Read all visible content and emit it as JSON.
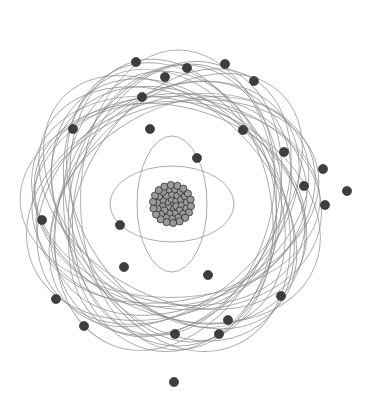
{
  "diagram": {
    "title": "Atom model illustration",
    "colors": {
      "background": "#ffffff",
      "orbit": "#8a8a8a",
      "electron": "#3e3e3e",
      "nucleus": "#9a9a9a"
    },
    "center": [
      174,
      204
    ],
    "nucleus": {
      "cx": 172,
      "cy": 204,
      "r": 21
    },
    "inner_orbits": [
      {
        "rx": 62,
        "ry": 38,
        "rot": 0
      },
      {
        "rx": 35,
        "ry": 68,
        "rot": 0
      }
    ],
    "outer_orbits": {
      "count": 24,
      "rx": 150,
      "ry": 98
    },
    "electrons": [
      [
        136,
        62
      ],
      [
        165,
        77
      ],
      [
        187,
        68
      ],
      [
        225,
        64
      ],
      [
        254,
        81
      ],
      [
        142,
        97
      ],
      [
        150,
        129
      ],
      [
        243,
        130
      ],
      [
        73,
        129
      ],
      [
        197,
        158
      ],
      [
        284,
        152
      ],
      [
        323,
        169
      ],
      [
        304,
        186
      ],
      [
        347,
        191
      ],
      [
        325,
        205
      ],
      [
        42,
        220
      ],
      [
        120,
        225
      ],
      [
        124,
        267
      ],
      [
        208,
        275
      ],
      [
        281,
        296
      ],
      [
        56,
        299
      ],
      [
        84,
        326
      ],
      [
        228,
        320
      ],
      [
        219,
        334
      ],
      [
        175,
        334
      ],
      [
        174,
        382
      ]
    ]
  }
}
